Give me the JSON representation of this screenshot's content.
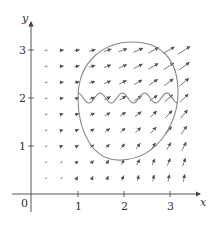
{
  "figure": {
    "type": "vector-field-diagram",
    "axes": {
      "x_label": "x",
      "y_label": "y",
      "origin_label": "0",
      "x_ticks": [
        "1",
        "2",
        "3"
      ],
      "y_ticks": [
        "1",
        "2",
        "3"
      ],
      "x_range": [
        0,
        3.5
      ],
      "y_range": [
        0,
        3.4
      ]
    },
    "colors": {
      "axis": "#444444",
      "arrow": "#555555",
      "curve": "#888888",
      "text": "#333333"
    },
    "vector_field": {
      "grid_x_start": 0.33,
      "grid_y_start": 0.33,
      "grid_step": 0.333,
      "cols": 10,
      "rows": 9,
      "description": "Arrows grow in length toward the right; near the top they point mostly right, near the bottom-right they point mostly up."
    },
    "curves": [
      {
        "name": "closed-egg-curve",
        "description": "Closed curve spanning x≈1 to 3, y≈0.85 to 3.0"
      },
      {
        "name": "wavy-curve",
        "description": "Oscillating curve around y=2 from x≈1 to x≈2.9"
      }
    ]
  }
}
